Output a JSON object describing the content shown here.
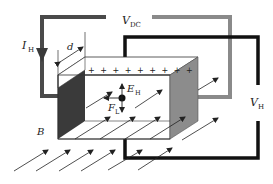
{
  "diagram": {
    "labels": {
      "v_dc": {
        "main": "V",
        "sub": "DC"
      },
      "i_h": {
        "main": "I",
        "sub": "H"
      },
      "d": {
        "main": "d"
      },
      "e_h": {
        "main": "E",
        "sub": "H"
      },
      "f_l": {
        "main": "F",
        "sub": "L"
      },
      "b": {
        "main": "B"
      },
      "v_h": {
        "main": "V",
        "sub": "H"
      }
    },
    "charges": "+ + + + + + + + +",
    "colors": {
      "supply_wire": "#8a8a8a",
      "current_wire": "#4a4a4a",
      "hall_wire": "#111111",
      "left_face": "#3a3a3a",
      "right_face": "#8c8c8c",
      "background": "#ffffff"
    },
    "field_arrow_count": 14
  }
}
